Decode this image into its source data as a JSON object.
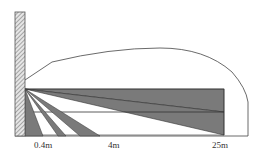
{
  "diagram": {
    "type": "sensor-detection-zones",
    "labels": {
      "near": "0.4m",
      "mid": "4m",
      "far": "25m"
    },
    "colors": {
      "zone_fill": "#7a7a7a",
      "line": "#333333",
      "wall_hatch": "#888888",
      "background": "#ffffff"
    }
  }
}
